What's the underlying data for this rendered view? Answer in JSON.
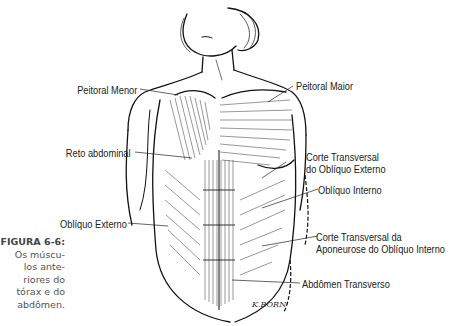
{
  "figure": {
    "number": "FIGURA 6-6:",
    "caption_lines": [
      "Os múscu-",
      "los ante-",
      "riores do",
      "tórax e do",
      "abdômen."
    ],
    "signature": "K.BORN"
  },
  "labels": {
    "peitoral_menor": "Peitoral Menor",
    "peitoral_maior": "Peitoral Maior",
    "reto_abdominal": "Reto abdominal",
    "corte_obliquo_externo_1": "Corte Transversal",
    "corte_obliquo_externo_2": "do Oblíquo Externo",
    "obliquo_interno": "Oblíquo Interno",
    "obliquo_externo": "Oblíquo Externo",
    "corte_aponeurose_1": "Corte Transversal da",
    "corte_aponeurose_2": "Aponeurose do Oblíquo Interno",
    "abdomen_transverso": "Abdômen Transverso"
  }
}
